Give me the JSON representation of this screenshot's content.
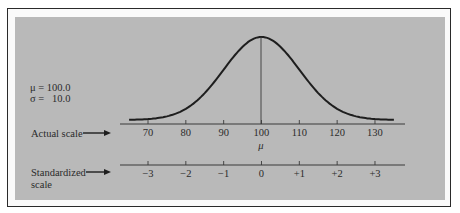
{
  "figure": {
    "params": {
      "mu_label": "μ = 100.0",
      "sigma_label": "σ =   10.0"
    },
    "actual_scale": {
      "label": "Actual scale",
      "ticks": [
        "70",
        "80",
        "90",
        "100",
        "110",
        "120",
        "130"
      ],
      "mean_label": "μ"
    },
    "standardized_scale": {
      "label_line1": "Standardized",
      "label_line2": "scale",
      "ticks": [
        "−3",
        "−2",
        "−1",
        "0",
        "+1",
        "+2",
        "+3"
      ]
    },
    "colors": {
      "panel": "#b9b9b9",
      "line": "#1e1e1e",
      "border": "#2a2a2a"
    }
  },
  "chart_data": {
    "type": "line",
    "title": "",
    "mean": 100.0,
    "std_dev": 10.0,
    "x_actual": [
      70,
      80,
      90,
      100,
      110,
      120,
      130
    ],
    "x_standardized": [
      -3,
      -2,
      -1,
      0,
      1,
      2,
      3
    ],
    "xlabel": "Actual scale",
    "x2label": "Standardized scale",
    "xlim": [
      64,
      136
    ],
    "grid": false,
    "annotations": [
      "μ = 100.0",
      "σ = 10.0",
      "μ"
    ]
  }
}
